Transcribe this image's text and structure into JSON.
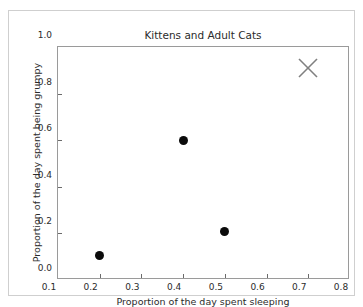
{
  "chart_data": {
    "type": "scatter",
    "title": "Kittens and Adult Cats",
    "xlabel": "Proportion of the day spent sleeping",
    "ylabel": "Proportion of the day spent being grumpy",
    "xlim": [
      0.1,
      0.8
    ],
    "ylim": [
      0.0,
      1.0
    ],
    "grid": false,
    "legend": "none",
    "xticks": [
      "0.1",
      "0.2",
      "0.3",
      "0.4",
      "0.5",
      "0.6",
      "0.7",
      "0.8"
    ],
    "xtick_values": [
      0.1,
      0.2,
      0.3,
      0.4,
      0.5,
      0.6,
      0.7,
      0.8
    ],
    "yticks": [
      "0.0",
      "0.2",
      "0.4",
      "0.6",
      "0.8",
      "1.0"
    ],
    "ytick_values": [
      0.0,
      0.2,
      0.4,
      0.6,
      0.8,
      1.0
    ],
    "series": [
      {
        "name": "kittens-and-cats",
        "marker": "circle",
        "color": "#0b0b0b",
        "x": [
          0.2,
          0.4,
          0.5
        ],
        "y": [
          0.105,
          0.6,
          0.21
        ],
        "points": [
          {
            "x": 0.2,
            "y": 0.105
          },
          {
            "x": 0.4,
            "y": 0.6
          },
          {
            "x": 0.5,
            "y": 0.21
          }
        ]
      },
      {
        "name": "x-annotation-marker",
        "marker": "x",
        "color": "#808080",
        "x": [
          0.7
        ],
        "y": [
          0.91
        ],
        "points": [
          {
            "x": 0.7,
            "y": 0.91
          }
        ]
      }
    ]
  },
  "figure": {
    "border_color": "#cfcfcf",
    "axes_border_color": "#9a9a9a",
    "background": "#ffffff",
    "tick_color": "#6b6b6b"
  }
}
